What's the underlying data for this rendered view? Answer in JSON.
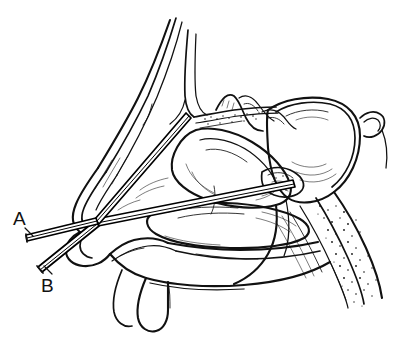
{
  "figure": {
    "style": "black-and-white-line-drawing",
    "background_color": "#ffffff",
    "ink_color": "#111111",
    "width": 415,
    "height": 339
  },
  "labels": [
    {
      "id": "A",
      "text": "A",
      "x": 13,
      "y": 209,
      "refers_to": "upper-instrument",
      "description": "Leader tick pointing down-right to the horizontal instrument shaft entering the nostril"
    },
    {
      "id": "B",
      "text": "B",
      "x": 41,
      "y": 276,
      "refers_to": "lower-instrument",
      "description": "Leader tick pointing up-right to the obliquely angled instrument shaft"
    }
  ],
  "instruments": [
    {
      "name": "upper-instrument",
      "label": "A",
      "entry_point": [
        97,
        222
      ],
      "external_end": [
        25,
        238
      ],
      "internal_tip": [
        189,
        117
      ],
      "target": "ethmoid-cribriform-region",
      "orientation": "angled-superiorly-and-posteriorly"
    },
    {
      "name": "lower-instrument",
      "label": "B",
      "entry_point": [
        97,
        222
      ],
      "external_end": [
        36,
        271
      ],
      "internal_tip": [
        294,
        183
      ],
      "target": "sphenoid-sinus-ostium",
      "orientation": "angled-inferiorly-externally-posteriorly-internally"
    }
  ],
  "anatomy": [
    {
      "name": "frontal-sinus-nasal-bone",
      "region": "superior-anterior"
    },
    {
      "name": "nasal-dorsum",
      "region": "anterior"
    },
    {
      "name": "nasal-tip-columella",
      "region": "anterior-inferior"
    },
    {
      "name": "nostril-nasal-vestibule",
      "region": "anterior-inferior"
    },
    {
      "name": "cribriform-plate",
      "region": "superior"
    },
    {
      "name": "superior-turbinate",
      "region": "posterior-superior"
    },
    {
      "name": "middle-turbinate",
      "region": "middle"
    },
    {
      "name": "inferior-turbinate",
      "region": "inferior"
    },
    {
      "name": "sphenoid-sinus",
      "region": "posterior-superior"
    },
    {
      "name": "sphenoethmoidal-recess",
      "region": "posterior-superior"
    },
    {
      "name": "clivus-cancellous-bone",
      "region": "posterior"
    },
    {
      "name": "sella-turcica",
      "region": "posterior-superior"
    },
    {
      "name": "hard-palate",
      "region": "inferior"
    },
    {
      "name": "soft-palate-uvula",
      "region": "inferior-posterior"
    },
    {
      "name": "nasopharynx",
      "region": "posterior-inferior"
    }
  ]
}
